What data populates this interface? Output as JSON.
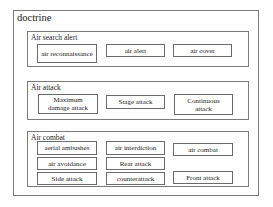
{
  "diagram": {
    "title": "doctrine",
    "sections": [
      {
        "label": "Air search alert",
        "items": [
          "air reconnaissance",
          "air alert",
          "air  cover"
        ]
      },
      {
        "label": "Air attack",
        "items": [
          "Maximum\ndamage attack",
          "Stage attack",
          "Continuous\nattack"
        ]
      },
      {
        "label": "Air combat",
        "items": [
          "aerial ambushes",
          "air interdiction",
          "air combat",
          "air avoidance",
          "Rear attack",
          "Side attack",
          "counterattack",
          "Front attack"
        ]
      }
    ]
  },
  "colors": {
    "border": "#7a7a7a",
    "text": "#222222",
    "background": "#ffffff"
  }
}
